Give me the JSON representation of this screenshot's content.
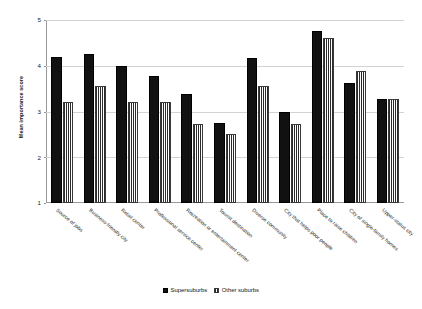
{
  "chart_data": {
    "type": "bar",
    "title": "",
    "xlabel": "",
    "ylabel": "Mean importance score",
    "ylim": [
      1,
      5
    ],
    "yticks": [
      1,
      2,
      3,
      4,
      5
    ],
    "grid": true,
    "legend_position": "bottom-center",
    "categories": [
      "Source of jobs",
      "Business-friendly city",
      "Retail center",
      "Professional service center",
      "Recreation or entertainment center",
      "Tourist destination",
      "Diverse community",
      "City that helps poor people",
      "Place to raise children",
      "City of single-family homes",
      "Upper-status city"
    ],
    "series": [
      {
        "name": "Supersuburbs",
        "style": "solid-black",
        "values": [
          4.2,
          4.25,
          4.0,
          3.78,
          3.38,
          2.75,
          4.18,
          3.0,
          4.75,
          3.62,
          3.28
        ]
      },
      {
        "name": "Other suburbs",
        "style": "vertical-hatch",
        "values": [
          3.2,
          3.55,
          3.2,
          3.2,
          2.72,
          2.5,
          3.55,
          2.72,
          4.6,
          3.88,
          3.28
        ]
      }
    ]
  },
  "legend": {
    "items": [
      {
        "label": "Supersuburbs"
      },
      {
        "label": "Other suburbs"
      }
    ]
  }
}
